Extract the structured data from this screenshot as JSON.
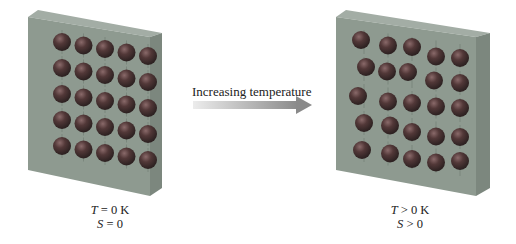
{
  "arrow": {
    "label": "Increasing temperature",
    "color_start": "#e8e8e8",
    "color_end": "#8c8c8c"
  },
  "panels": [
    {
      "id": "ordered",
      "temperature_label": "T = 0 K",
      "entropy_label": "S = 0",
      "temperature_var": "T",
      "temperature_rel": " = 0 K",
      "entropy_var": "S",
      "entropy_rel": " = 0",
      "rows": 5,
      "cols": 5,
      "disorder": "none"
    },
    {
      "id": "disordered",
      "temperature_label": "T > 0 K",
      "entropy_label": "S > 0",
      "temperature_var": "T",
      "temperature_rel": " > 0 K",
      "entropy_var": "S",
      "entropy_rel": " > 0",
      "rows": 5,
      "cols": 5,
      "disorder": "thermal vibration offsets"
    }
  ],
  "colors": {
    "panel_front": "#8e9a90",
    "panel_side": "#7c877e",
    "panel_top": "#a3ada5",
    "sphere_base": "#4a3434",
    "sphere_highlight": "#8a6a6a",
    "background": "#ffffff"
  }
}
